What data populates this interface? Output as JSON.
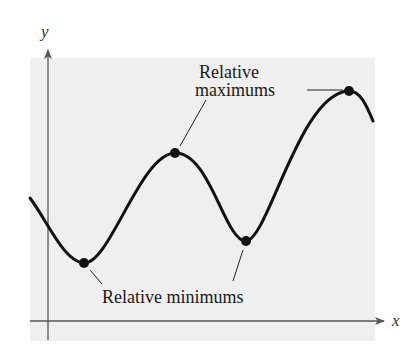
{
  "figure": {
    "type": "function graph with relative extrema",
    "axes": {
      "x_label": "x",
      "y_label": "y"
    },
    "annotations": {
      "max_label_line1": "Relative",
      "max_label_line2": "maximums",
      "min_label": "Relative minimums"
    },
    "colors": {
      "background_panel": "#efefef",
      "curve": "#111111",
      "axes": "#555555",
      "text": "#1a1a1a"
    },
    "points": {
      "relative_minimums": [
        {
          "x": 84,
          "y": 263
        },
        {
          "x": 246,
          "y": 241
        }
      ],
      "relative_maximums": [
        {
          "x": 175,
          "y": 153
        },
        {
          "x": 349,
          "y": 91
        }
      ]
    }
  }
}
